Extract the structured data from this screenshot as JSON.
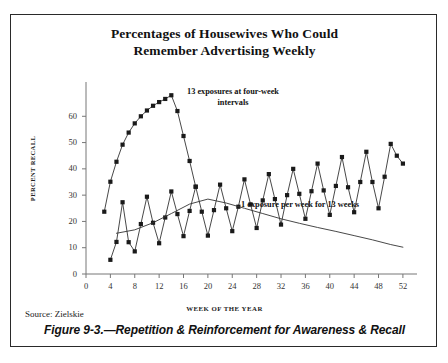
{
  "figure": {
    "title_line1": "Percentages of Housewives Who Could",
    "title_line2": "Remember Advertising Weekly",
    "source": "Source: Zielskie",
    "caption": "Figure 9-3.—Repetition & Reinforcement for Awareness & Recall",
    "annotation_exposures": "13 exposures at four-week intervals",
    "annotation_weekly": "1 exposure per week for 13 weeks",
    "border_color": "#2a2a2a"
  },
  "chart_data": {
    "type": "line",
    "title": "Percentages of Housewives Who Could Remember Advertising Weekly",
    "xlabel": "WEEK OF THE YEAR",
    "ylabel": "PERCENT RECALL",
    "xlim": [
      0,
      53
    ],
    "ylim": [
      0,
      70
    ],
    "xticks": [
      0,
      4,
      8,
      12,
      16,
      20,
      24,
      28,
      32,
      36,
      40,
      44,
      48,
      52
    ],
    "yticks": [
      0,
      10,
      20,
      30,
      40,
      50,
      60
    ],
    "grid": false,
    "legend": false,
    "line_color": "#333333",
    "marker_color": "#1a1a1a",
    "series": [
      {
        "name": "13 exposures at four-week intervals",
        "marker": "square",
        "x": [
          3,
          4,
          5,
          6,
          7,
          8,
          9,
          10,
          11,
          12,
          13,
          14,
          15,
          16,
          17,
          18
        ],
        "y": [
          23.7,
          35.1,
          42.7,
          49.2,
          53.8,
          57.3,
          60.0,
          62.2,
          64.0,
          65.4,
          66.6,
          68.0,
          62.0,
          52.5,
          43.0,
          33.2
        ]
      },
      {
        "name": "1 exposure per week for 13 weeks",
        "marker": "square",
        "x": [
          4,
          5,
          6,
          7,
          8,
          9,
          10,
          11,
          12,
          13,
          14,
          15,
          16,
          17,
          18,
          19,
          20,
          21,
          22,
          23,
          24,
          25,
          26,
          27,
          28,
          29,
          30,
          31,
          32,
          33,
          34,
          35,
          36,
          37,
          38,
          39,
          40,
          41,
          42,
          43,
          44,
          45,
          46,
          47,
          48,
          49,
          50,
          51,
          52
        ],
        "y": [
          5.4,
          12.2,
          27.3,
          12.1,
          8.6,
          19.0,
          29.4,
          19.5,
          11.7,
          21.5,
          31.4,
          22.8,
          14.4,
          24.0,
          33.2,
          23.7,
          14.6,
          24.3,
          34.0,
          25.0,
          16.3,
          25.6,
          36.0,
          26.5,
          17.5,
          28.0,
          38.0,
          28.5,
          18.8,
          30.0,
          40.0,
          30.5,
          21.0,
          31.5,
          42.0,
          31.8,
          22.5,
          33.5,
          44.5,
          33.0,
          23.5,
          35.0,
          46.5,
          35.0,
          25.0,
          37.0,
          49.5,
          45.0,
          42.0
        ]
      },
      {
        "name": "decay curve",
        "marker": "none",
        "x": [
          5,
          8,
          11,
          14,
          17,
          20,
          23,
          26,
          29,
          32,
          35,
          38,
          41,
          44,
          47,
          50,
          52
        ],
        "y": [
          15.5,
          16.8,
          19.5,
          23.0,
          26.6,
          28.5,
          27.0,
          25.0,
          23.0,
          21.0,
          19.3,
          17.7,
          16.2,
          14.6,
          13.0,
          11.2,
          10.2
        ]
      }
    ]
  }
}
